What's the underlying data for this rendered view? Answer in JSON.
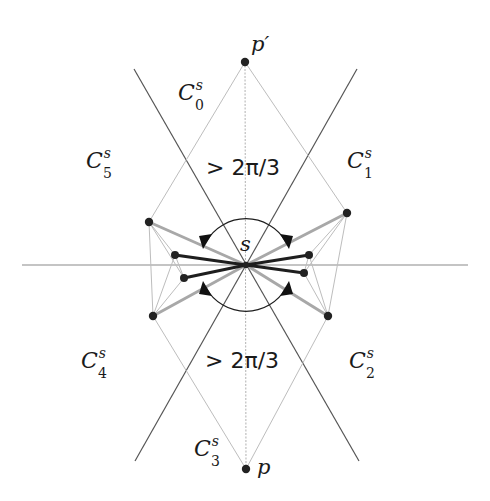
{
  "diagram": {
    "center_label": "s",
    "top_point_label": "p′",
    "bottom_point_label": "p",
    "upper_angle_label": "> 2π/3",
    "lower_angle_label": "> 2π/3",
    "cones": [
      {
        "name": "C",
        "sup": "s",
        "sub": "0"
      },
      {
        "name": "C",
        "sup": "s",
        "sub": "1"
      },
      {
        "name": "C",
        "sup": "s",
        "sub": "2"
      },
      {
        "name": "C",
        "sup": "s",
        "sub": "3"
      },
      {
        "name": "C",
        "sup": "s",
        "sub": "4"
      },
      {
        "name": "C",
        "sup": "s",
        "sub": "5"
      }
    ],
    "colors": {
      "axis_line": "#8a8a8a",
      "cone_line": "#555555",
      "thin_line": "#b8b8b8",
      "gray_edge": "#a8a8a8",
      "dark_edge": "#1e1e1e",
      "node": "#222222"
    }
  }
}
